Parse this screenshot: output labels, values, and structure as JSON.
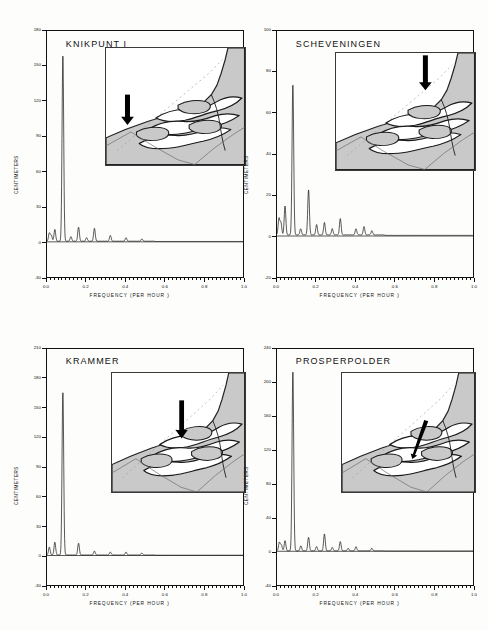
{
  "figure": {
    "background": "#fdfdfc",
    "ink": "#111111",
    "land_fill": "#c9c9c9",
    "water_fill": "#ffffff",
    "arrow_color": "#000000"
  },
  "axis_common": {
    "xlabel": "FREQUENCY  (PER   HOUR     )",
    "ylabel": "CENTIMETERS",
    "xticks": [
      "0.0",
      "0.2",
      "0.4",
      "0.6",
      "0.8",
      "1.0"
    ],
    "xlim": [
      0.0,
      1.0
    ]
  },
  "panels": [
    {
      "id": "knikpunt-i",
      "title": "KNIKPUNT I",
      "yticks": [
        "180",
        "150",
        "120",
        "90",
        "60",
        "30",
        "0",
        "-30"
      ],
      "ylim": [
        -30,
        180
      ],
      "arrow": {
        "type": "down-arrow",
        "x": 0.155,
        "y": 0.4,
        "len": 0.26,
        "rot": 0
      }
    },
    {
      "id": "scheveningen",
      "title": "SCHEVENINGEN",
      "yticks": [
        "100",
        "80",
        "60",
        "40",
        "20",
        "0",
        "-20"
      ],
      "ylim": [
        -20,
        100
      ],
      "arrow": {
        "type": "down-arrow",
        "x": 0.645,
        "y": 0.02,
        "len": 0.3,
        "rot": 0
      }
    },
    {
      "id": "krammer",
      "title": "KRAMMER",
      "yticks": [
        "210",
        "180",
        "150",
        "120",
        "90",
        "60",
        "30",
        "0",
        "-30"
      ],
      "ylim": [
        -30,
        210
      ],
      "arrow": {
        "type": "down-arrow",
        "x": 0.525,
        "y": 0.23,
        "len": 0.32,
        "rot": 0
      }
    },
    {
      "id": "prosperpolder",
      "title": "PROSPERPOLDER",
      "yticks": [
        "240",
        "200",
        "160",
        "120",
        "80",
        "40",
        "0",
        "-40"
      ],
      "ylim": [
        -40,
        240
      ],
      "arrow": {
        "type": "slim-arrow",
        "x": 0.635,
        "y": 0.4,
        "len": 0.34,
        "rot": 18
      }
    }
  ],
  "chart_data": [
    {
      "type": "line",
      "panel": "knikpunt-i",
      "title": "KNIKPUNT I",
      "xlabel": "FREQUENCY (PER HOUR)",
      "ylabel": "CENTIMETERS",
      "xlim": [
        0.0,
        1.0
      ],
      "ylim": [
        -30,
        180
      ],
      "xticks": [
        0.0,
        0.2,
        0.4,
        0.6,
        0.8,
        1.0
      ],
      "yticks": [
        -30,
        0,
        30,
        60,
        90,
        120,
        150,
        180
      ],
      "grid": false,
      "legend": null,
      "peaks": [
        {
          "freq": 0.012,
          "amp": 7
        },
        {
          "freq": 0.022,
          "amp": 5
        },
        {
          "freq": 0.04,
          "amp": 10
        },
        {
          "freq": 0.081,
          "amp": 158
        },
        {
          "freq": 0.122,
          "amp": 4
        },
        {
          "freq": 0.161,
          "amp": 12
        },
        {
          "freq": 0.202,
          "amp": 3
        },
        {
          "freq": 0.242,
          "amp": 11
        },
        {
          "freq": 0.323,
          "amp": 5
        },
        {
          "freq": 0.403,
          "amp": 3
        },
        {
          "freq": 0.484,
          "amp": 2
        }
      ]
    },
    {
      "type": "line",
      "panel": "scheveningen",
      "title": "SCHEVENINGEN",
      "xlabel": "FREQUENCY (PER HOUR)",
      "ylabel": "CENTIMETERS",
      "xlim": [
        0.0,
        1.0
      ],
      "ylim": [
        -20,
        100
      ],
      "xticks": [
        0.0,
        0.2,
        0.4,
        0.6,
        0.8,
        1.0
      ],
      "yticks": [
        -20,
        0,
        20,
        40,
        60,
        80,
        100
      ],
      "grid": false,
      "legend": null,
      "peaks": [
        {
          "freq": 0.01,
          "amp": 8
        },
        {
          "freq": 0.02,
          "amp": 6
        },
        {
          "freq": 0.041,
          "amp": 14
        },
        {
          "freq": 0.081,
          "amp": 73
        },
        {
          "freq": 0.121,
          "amp": 3
        },
        {
          "freq": 0.161,
          "amp": 22
        },
        {
          "freq": 0.202,
          "amp": 5
        },
        {
          "freq": 0.242,
          "amp": 6
        },
        {
          "freq": 0.282,
          "amp": 3
        },
        {
          "freq": 0.323,
          "amp": 8
        },
        {
          "freq": 0.403,
          "amp": 3
        },
        {
          "freq": 0.444,
          "amp": 4
        },
        {
          "freq": 0.484,
          "amp": 2
        }
      ]
    },
    {
      "type": "line",
      "panel": "krammer",
      "title": "KRAMMER",
      "xlabel": "FREQUENCY (PER HOUR)",
      "ylabel": "CENTIMETERS",
      "xlim": [
        0.0,
        1.0
      ],
      "ylim": [
        -30,
        210
      ],
      "xticks": [
        0.0,
        0.2,
        0.4,
        0.6,
        0.8,
        1.0
      ],
      "yticks": [
        -30,
        0,
        30,
        60,
        90,
        120,
        150,
        180,
        210
      ],
      "grid": false,
      "legend": null,
      "peaks": [
        {
          "freq": 0.012,
          "amp": 8
        },
        {
          "freq": 0.04,
          "amp": 13
        },
        {
          "freq": 0.081,
          "amp": 165
        },
        {
          "freq": 0.161,
          "amp": 12
        },
        {
          "freq": 0.242,
          "amp": 4
        },
        {
          "freq": 0.323,
          "amp": 3
        },
        {
          "freq": 0.403,
          "amp": 3
        },
        {
          "freq": 0.484,
          "amp": 2
        }
      ]
    },
    {
      "type": "line",
      "panel": "prosperpolder",
      "title": "PROSPERPOLDER",
      "xlabel": "FREQUENCY (PER HOUR)",
      "ylabel": "CENTIMETERS",
      "xlim": [
        0.0,
        1.0
      ],
      "ylim": [
        -40,
        240
      ],
      "xticks": [
        0.0,
        0.2,
        0.4,
        0.6,
        0.8,
        1.0
      ],
      "yticks": [
        -40,
        0,
        40,
        80,
        120,
        160,
        200,
        240
      ],
      "grid": false,
      "legend": null,
      "peaks": [
        {
          "freq": 0.012,
          "amp": 10
        },
        {
          "freq": 0.022,
          "amp": 7
        },
        {
          "freq": 0.041,
          "amp": 12
        },
        {
          "freq": 0.081,
          "amp": 212
        },
        {
          "freq": 0.122,
          "amp": 6
        },
        {
          "freq": 0.161,
          "amp": 16
        },
        {
          "freq": 0.202,
          "amp": 5
        },
        {
          "freq": 0.242,
          "amp": 20
        },
        {
          "freq": 0.282,
          "amp": 4
        },
        {
          "freq": 0.323,
          "amp": 11
        },
        {
          "freq": 0.363,
          "amp": 3
        },
        {
          "freq": 0.403,
          "amp": 5
        },
        {
          "freq": 0.484,
          "amp": 3
        }
      ]
    }
  ]
}
